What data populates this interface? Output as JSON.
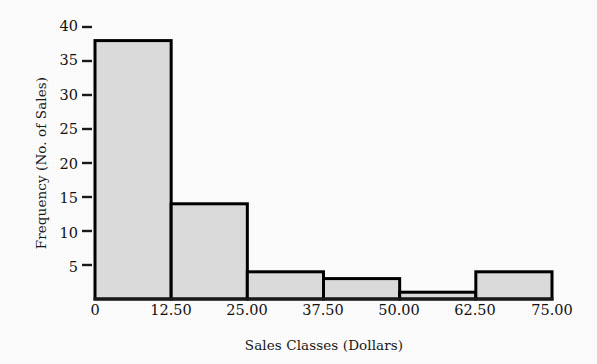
{
  "chart_data": {
    "type": "bar",
    "title": "",
    "subtitle": "",
    "xlabel": "Sales Classes (Dollars)",
    "ylabel": "Frequency (No. of Sales)",
    "categories": [
      "0–12.50",
      "12.50–25.00",
      "25.00–37.50",
      "37.50–50.00",
      "50.00–62.50",
      "62.50–75.00"
    ],
    "bin_edges": [
      0,
      12.5,
      25,
      37.5,
      50,
      62.5,
      75
    ],
    "values": [
      38,
      14,
      4,
      3,
      1,
      4
    ],
    "xlim": [
      0,
      75
    ],
    "ylim": [
      0,
      40
    ],
    "x_tick_labels": [
      "0",
      "12.50",
      "25.00",
      "37.50",
      "50.00",
      "62.50",
      "75.00"
    ],
    "x_tick_values": [
      0,
      12.5,
      25,
      37.5,
      50,
      62.5,
      75
    ],
    "y_tick_labels": [
      "5",
      "10",
      "15",
      "20",
      "25",
      "30",
      "35",
      "40"
    ],
    "y_tick_values": [
      5,
      10,
      15,
      20,
      25,
      30,
      35,
      40
    ],
    "grid": false,
    "legend": false,
    "legend_position": "none",
    "bar_fill_color": "#dedede",
    "bar_edge_color": "#000000",
    "axis_color": "#1a1a1a",
    "background_color": "#ffffff",
    "text_color": "#121212"
  },
  "axes": {
    "y_title": "Frequency (No. of Sales)",
    "x_title": "Sales Classes (Dollars)"
  },
  "y_ticks": [
    {
      "label": "40"
    },
    {
      "label": "35"
    },
    {
      "label": "30"
    },
    {
      "label": "25"
    },
    {
      "label": "20"
    },
    {
      "label": "15"
    },
    {
      "label": "10"
    },
    {
      "label": "5"
    }
  ],
  "x_ticks": [
    {
      "label": "0"
    },
    {
      "label": "12.50"
    },
    {
      "label": "25.00"
    },
    {
      "label": "37.50"
    },
    {
      "label": "50.00"
    },
    {
      "label": "62.50"
    },
    {
      "label": "75.00"
    }
  ]
}
